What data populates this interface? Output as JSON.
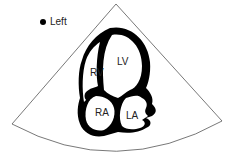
{
  "diagram": {
    "type": "apical four-chamber echocardiogram schematic",
    "orientation_marker": {
      "label": "Left",
      "icon": "dot-icon"
    },
    "chambers": [
      {
        "id": "rv",
        "label": "RV"
      },
      {
        "id": "lv",
        "label": "LV"
      },
      {
        "id": "ra",
        "label": "RA"
      },
      {
        "id": "la",
        "label": "LA"
      }
    ],
    "colors": {
      "wall": "#000000",
      "sector_outline": "#555555",
      "background": "#ffffff"
    }
  }
}
